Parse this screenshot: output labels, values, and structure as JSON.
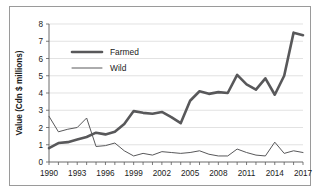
{
  "chart_data": {
    "type": "line",
    "title": "",
    "xlabel": "",
    "ylabel": "Value (Cdn $ millions)",
    "xlim": [
      1990,
      2017
    ],
    "ylim": [
      0,
      8
    ],
    "yticks": [
      0,
      1,
      2,
      3,
      4,
      5,
      6,
      7,
      8
    ],
    "ytick_labels": [
      "0",
      "1",
      "2",
      "3",
      "4",
      "5",
      "6",
      "7",
      "8"
    ],
    "xticks": [
      1990,
      1993,
      1996,
      1999,
      2002,
      2005,
      2008,
      2011,
      2014,
      2017
    ],
    "xtick_labels": [
      "1990",
      "1993",
      "1996",
      "1999",
      "2002",
      "2005",
      "2008",
      "2011",
      "2014",
      "2017"
    ],
    "x": [
      1990,
      1991,
      1992,
      1993,
      1994,
      1995,
      1996,
      1997,
      1998,
      1999,
      2000,
      2001,
      2002,
      2003,
      2004,
      2005,
      2006,
      2007,
      2008,
      2009,
      2010,
      2011,
      2012,
      2013,
      2014,
      2015,
      2016,
      2017
    ],
    "grid": true,
    "grid_axis": "y",
    "legend_position": "upper-left",
    "series": [
      {
        "name": "Farmed",
        "style": "thick",
        "values": [
          0.8,
          1.1,
          1.15,
          1.3,
          1.45,
          1.7,
          1.6,
          1.75,
          2.2,
          2.95,
          2.85,
          2.8,
          2.9,
          2.6,
          2.25,
          3.55,
          4.1,
          3.95,
          4.05,
          4.0,
          5.05,
          4.5,
          4.2,
          4.85,
          3.9,
          5.0,
          7.5,
          7.35
        ]
      },
      {
        "name": "Wild",
        "style": "thin",
        "values": [
          2.65,
          1.75,
          1.9,
          2.0,
          2.55,
          0.9,
          0.95,
          1.1,
          0.65,
          0.35,
          0.5,
          0.4,
          0.6,
          0.55,
          0.5,
          0.55,
          0.65,
          0.45,
          0.35,
          0.35,
          0.75,
          0.55,
          0.4,
          0.35,
          1.15,
          0.5,
          0.65,
          0.55
        ]
      }
    ]
  },
  "legend": {
    "items": [
      {
        "label": "Farmed"
      },
      {
        "label": "Wild"
      }
    ]
  }
}
